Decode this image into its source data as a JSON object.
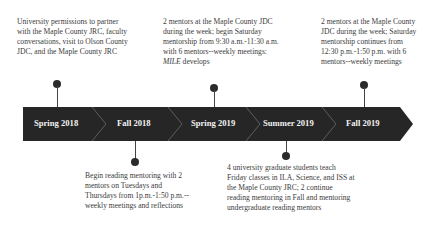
{
  "timeline": {
    "segments": [
      {
        "label": "Spring 2018"
      },
      {
        "label": "Fall 2018"
      },
      {
        "label": "Spring 2019"
      },
      {
        "label": "Summer 2019"
      },
      {
        "label": "Fall 2019"
      }
    ],
    "band_color": "#262626",
    "separator_color": "#5a5a5a"
  },
  "events": {
    "spring_2018": {
      "position": "above",
      "text": "University permissions to partner with the Maple County JRC, faculty conversations, visit to Olson County JDC, and the Maple County JRC"
    },
    "fall_2018": {
      "position": "below",
      "text": "Begin reading mentoring with 2 mentors on Tuesdays and Thursdays from 1p.m.-1:50 p.m.--weekly meetings and reflections"
    },
    "spring_2019": {
      "position": "above",
      "text_main": "2 mentors at the Maple County JDC during the week; begin Saturday mentorship from 9:30 a.m.-11:30 a.m. with 6 mentors--weekly meetings: ",
      "text_italic": "MILE",
      "text_tail": " develops"
    },
    "summer_2019": {
      "position": "below",
      "text": "4 university graduate students teach Friday classes in ILA, Science, and ISS at the Maple County JRC; 2 continue reading mentoring in Fall and mentoring undergraduate reading mentors"
    },
    "fall_2019": {
      "position": "above",
      "text": "2 mentors at the Maple County JDC during the week; Saturday mentorship continues from 12:30 p.m.-1:50 p.m. with 6 mentors--weekly meetings"
    }
  }
}
